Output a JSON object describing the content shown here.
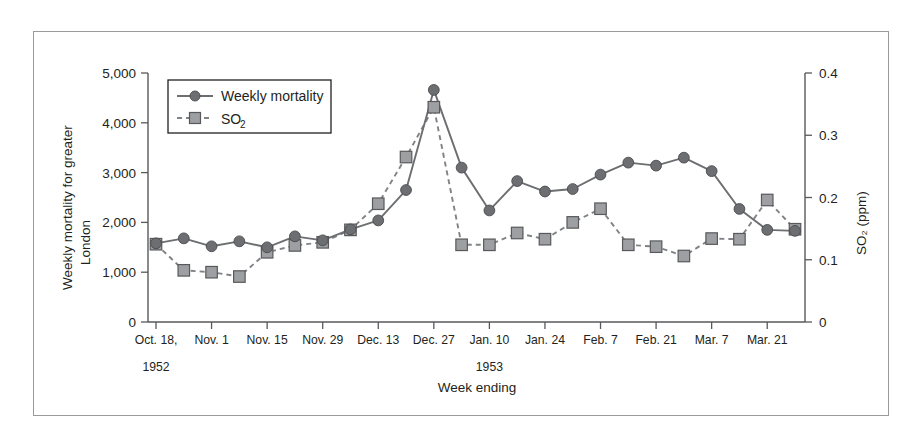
{
  "figure": {
    "border_color": "#9b9b9b",
    "background": "#ffffff"
  },
  "axes": {
    "left_title_line1": "Weekly mortality for greater",
    "left_title_line2": "London",
    "right_title": "SO₂ (ppm)",
    "x_title": "Week ending",
    "left_ticks": [
      "0",
      "1,000",
      "2,000",
      "3,000",
      "4,000",
      "5,000"
    ],
    "right_ticks": [
      "0",
      "0.1",
      "0.2",
      "0.3",
      "0.4"
    ],
    "year_label_left": "1952",
    "year_label_right": "1953"
  },
  "legend": {
    "items": [
      {
        "label": "Weekly mortality",
        "marker": "circle-solid-line",
        "color": "#6d6e71"
      },
      {
        "label": "SO",
        "sub": "2",
        "marker": "square-dashed-line",
        "color": "#9d9fa2"
      }
    ]
  },
  "chart_data": {
    "type": "line",
    "title": "",
    "xlabel": "Week ending",
    "ylabel": "Weekly mortality for greater London",
    "y2label": "SO₂ (ppm)",
    "ylim": [
      0,
      5000
    ],
    "y2lim": [
      0,
      0.4
    ],
    "grid": false,
    "legend_position": "top-left-inside",
    "x_tick_labels": [
      "Oct. 18,",
      "Nov. 1",
      "Nov. 15",
      "Nov. 29",
      "Dec. 13",
      "Dec. 27",
      "Jan. 10",
      "Jan. 24",
      "Feb. 7",
      "Feb. 21",
      "Mar. 7",
      "Mar. 21"
    ],
    "categories": [
      "Oct. 18",
      "Oct. 25",
      "Nov. 1",
      "Nov. 8",
      "Nov. 15",
      "Nov. 22",
      "Nov. 29",
      "Dec. 6",
      "Dec. 13",
      "Dec. 20",
      "Dec. 27",
      "Jan. 3",
      "Jan. 10",
      "Jan. 17",
      "Jan. 24",
      "Jan. 31",
      "Feb. 7",
      "Feb. 14",
      "Feb. 21",
      "Feb. 28",
      "Mar. 7",
      "Mar. 14",
      "Mar. 21",
      "Mar. 28"
    ],
    "series": [
      {
        "name": "Weekly mortality",
        "axis": "left",
        "marker": "circle",
        "linestyle": "solid",
        "color": "#6d6e71",
        "values": [
          1580,
          1680,
          1520,
          1620,
          1500,
          1720,
          1640,
          1860,
          2040,
          2650,
          4660,
          3100,
          2240,
          2830,
          2620,
          2670,
          2960,
          3200,
          3140,
          3300,
          3030,
          2270,
          1850,
          1830
        ]
      },
      {
        "name": "SO2",
        "axis": "right",
        "marker": "square",
        "linestyle": "dashed",
        "color": "#9d9fa2",
        "values": [
          0.125,
          0.083,
          0.08,
          0.073,
          0.112,
          0.123,
          0.128,
          0.148,
          0.19,
          0.265,
          0.345,
          0.124,
          0.124,
          0.143,
          0.133,
          0.16,
          0.182,
          0.124,
          0.121,
          0.106,
          0.134,
          0.133,
          0.196,
          0.149
        ]
      }
    ],
    "annotations": [
      {
        "text": "1952",
        "note": "year under Oct. 18 tick"
      },
      {
        "text": "1953",
        "note": "year under Jan. 10 tick"
      }
    ]
  }
}
